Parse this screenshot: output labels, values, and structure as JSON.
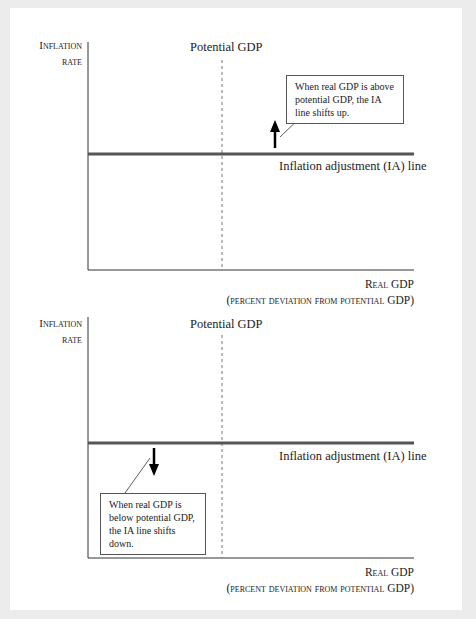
{
  "panels": [
    {
      "y_label_line1": "Inflation",
      "y_label_line2": "rate",
      "potential_label": "Potential GDP",
      "ia_label": "Inflation adjustment (IA) line",
      "note": "When real GDP is above potential GDP, the IA line shifts up.",
      "arrow_direction": "up",
      "x_label_line1": "Real GDP",
      "x_label_line2": "(percent deviation from potential GDP)"
    },
    {
      "y_label_line1": "Inflation",
      "y_label_line2": "rate",
      "potential_label": "Potential GDP",
      "ia_label": "Inflation adjustment (IA) line",
      "note": "When real GDP is below potential GDP, the IA line shifts down.",
      "arrow_direction": "down",
      "x_label_line1": "Real GDP",
      "x_label_line2": "(percent deviation from potential GDP)"
    }
  ],
  "colors": {
    "background": "#ececec",
    "panel": "#ffffff",
    "ia_line": "#555555",
    "axis": "#333333"
  }
}
